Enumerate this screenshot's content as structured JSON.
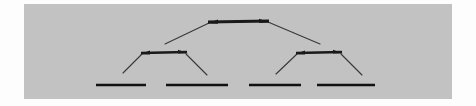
{
  "image": {
    "width": 476,
    "height": 106,
    "background_color": "#fdfdfd",
    "panel_color": "#c2c2c2",
    "panel": {
      "x": 24,
      "y": 4,
      "width": 428,
      "height": 95
    }
  },
  "diagram": {
    "type": "binary-tree",
    "levels": 3,
    "line_color": "#1a1a1a",
    "branch_color": "#383838",
    "nodes": [
      {
        "id": "root",
        "level": 0,
        "name": "root-node-bar",
        "x1": 184,
        "y1": 18,
        "x2": 245,
        "y2": 17,
        "thickness": 3.0,
        "arrow_left": true,
        "arrow_right": true
      },
      {
        "id": "internal-left",
        "level": 1,
        "name": "left-internal-node-bar",
        "x1": 117,
        "y1": 49,
        "x2": 163,
        "y2": 48,
        "thickness": 2.6,
        "arrow_left": true,
        "arrow_right": true
      },
      {
        "id": "internal-right",
        "level": 1,
        "name": "right-internal-node-bar",
        "x1": 272,
        "y1": 49,
        "x2": 318,
        "y2": 48,
        "thickness": 2.6,
        "arrow_left": true,
        "arrow_right": true
      },
      {
        "id": "leaf-1",
        "level": 2,
        "name": "leaf-node-bar-1",
        "x1": 72,
        "y1": 81,
        "x2": 122,
        "y2": 81,
        "thickness": 2.6,
        "arrow_left": false,
        "arrow_right": false
      },
      {
        "id": "leaf-2",
        "level": 2,
        "name": "leaf-node-bar-2",
        "x1": 142,
        "y1": 81,
        "x2": 204,
        "y2": 81,
        "thickness": 2.6,
        "arrow_left": false,
        "arrow_right": false
      },
      {
        "id": "leaf-3",
        "level": 2,
        "name": "leaf-node-bar-3",
        "x1": 225,
        "y1": 81,
        "x2": 277,
        "y2": 81,
        "thickness": 2.6,
        "arrow_left": false,
        "arrow_right": false
      },
      {
        "id": "leaf-4",
        "level": 2,
        "name": "leaf-node-bar-4",
        "x1": 293,
        "y1": 81,
        "x2": 351,
        "y2": 81,
        "thickness": 2.6,
        "arrow_left": false,
        "arrow_right": false
      }
    ],
    "branches": [
      {
        "id": "root-to-left",
        "from": "root",
        "to": "internal-left",
        "x1": 185,
        "y1": 19,
        "x2": 141,
        "y2": 40
      },
      {
        "id": "root-to-right",
        "from": "root",
        "to": "internal-right",
        "x1": 244,
        "y1": 18,
        "x2": 296,
        "y2": 40
      },
      {
        "id": "left-to-leaf1",
        "from": "internal-left",
        "to": "leaf-1",
        "x1": 118,
        "y1": 50,
        "x2": 99,
        "y2": 69
      },
      {
        "id": "left-to-leaf2",
        "from": "internal-left",
        "to": "leaf-2",
        "x1": 162,
        "y1": 50,
        "x2": 183,
        "y2": 71
      },
      {
        "id": "right-to-leaf3",
        "from": "internal-right",
        "to": "leaf-3",
        "x1": 273,
        "y1": 50,
        "x2": 252,
        "y2": 70
      },
      {
        "id": "right-to-leaf4",
        "from": "internal-right",
        "to": "leaf-4",
        "x1": 317,
        "y1": 50,
        "x2": 338,
        "y2": 71
      }
    ]
  }
}
